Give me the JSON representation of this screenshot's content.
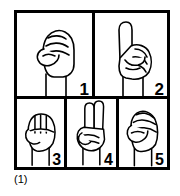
{
  "figure": {
    "caption": "(1)",
    "ink_color": "#000000",
    "background_color": "#ffffff",
    "border_color": "#000000",
    "layout": {
      "rows": 2,
      "top_row_panel_count": 2,
      "bottom_row_panel_count": 3
    }
  },
  "panels": [
    {
      "number": "1",
      "row": "top",
      "icon_name": "closed-fist-hand-icon",
      "handshape": "closed fist, fingers folded, thumb across front"
    },
    {
      "number": "2",
      "row": "top",
      "icon_name": "index-finger-up-hand-icon",
      "handshape": "index finger extended upward, other fingers folded"
    },
    {
      "number": "3",
      "row": "bottom",
      "icon_name": "curled-fingers-fist-hand-icon",
      "handshape": "fist with curled fingers, fingertips touching thumb"
    },
    {
      "number": "4",
      "row": "bottom",
      "icon_name": "two-fingers-up-hand-icon",
      "handshape": "index and middle fingers extended upward together"
    },
    {
      "number": "5",
      "row": "bottom",
      "icon_name": "closed-fist-thumb-side-hand-icon",
      "handshape": "closed fist with thumb resting at the side"
    }
  ]
}
